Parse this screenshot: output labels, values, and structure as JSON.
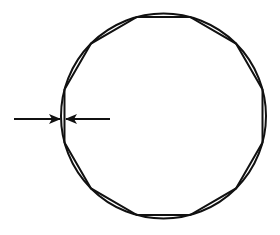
{
  "diagram": {
    "title": "",
    "shapes": {
      "circle": {
        "role": "circumscribed-circle"
      },
      "polygon": {
        "role": "inscribed-regular-polygon",
        "sides": 12,
        "orientation": "flat sides at top, bottom, left and right"
      }
    },
    "annotation": {
      "type": "dimension-arrows",
      "meaning": "maximum deviation between circle and polygon edge",
      "location": "left side",
      "label": ""
    },
    "colors": {
      "stroke": "#111111",
      "background": "#ffffff"
    }
  }
}
